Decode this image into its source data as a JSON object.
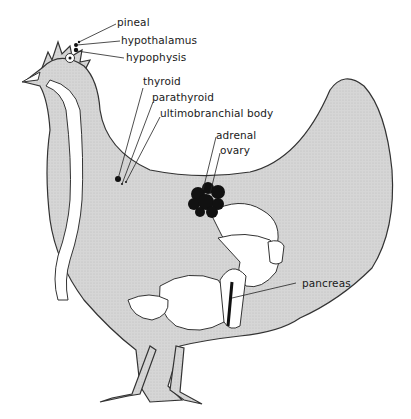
{
  "diagram": {
    "labels": {
      "pineal": "pineal",
      "hypothalamus": "hypothalamus",
      "hypophysis": "hypophysis",
      "thyroid": "thyroid",
      "parathyroid": "parathyroid",
      "ultimobranchial": "ultimobranchial body",
      "adrenal": "adrenal",
      "ovary": "ovary",
      "pancreas": "pancreas"
    },
    "colors": {
      "body_fill": "#d9d9d9",
      "outline": "#333333",
      "organ_fill": "#ffffff",
      "gland_fill": "#111111"
    }
  }
}
